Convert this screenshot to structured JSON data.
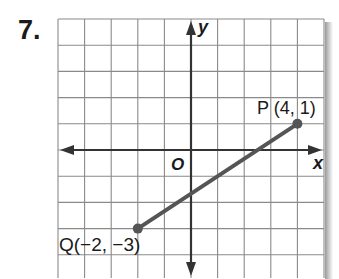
{
  "problem": {
    "number": "7."
  },
  "graph": {
    "axes": {
      "x_label": "x",
      "y_label": "y",
      "origin_label": "O"
    },
    "grid": {
      "x_range": [
        -5,
        5
      ],
      "y_range": [
        -5,
        5
      ]
    },
    "segment": {
      "color": "#555555",
      "endpoints": [
        {
          "name": "P",
          "x": 4,
          "y": 1,
          "label": "P (4, 1)"
        },
        {
          "name": "Q",
          "x": -2,
          "y": -3,
          "label": "Q(−2, −3)"
        }
      ]
    }
  },
  "chart_data": {
    "type": "scatter",
    "title": "",
    "xlabel": "x",
    "ylabel": "y",
    "xlim": [
      -5,
      5
    ],
    "ylim": [
      -5,
      5
    ],
    "grid": true,
    "series": [
      {
        "name": "segment PQ",
        "points": [
          {
            "label": "P",
            "x": 4,
            "y": 1
          },
          {
            "label": "Q",
            "x": -2,
            "y": -3
          }
        ],
        "connected": true
      }
    ],
    "annotations": [
      "P (4, 1)",
      "Q(−2, −3)",
      "O"
    ]
  }
}
